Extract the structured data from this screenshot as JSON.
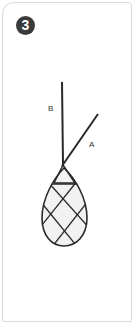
{
  "step": {
    "number": "3",
    "badge_color": "#3a3a3a"
  },
  "illustration": {
    "subject": "wire-wrapped teardrop stone pendant with two cords",
    "cords": [
      {
        "id": "A",
        "label": "A"
      },
      {
        "id": "B",
        "label": "B"
      }
    ],
    "stroke_color": "#2a2a2a",
    "stone_fill": "#f2f2f2"
  }
}
